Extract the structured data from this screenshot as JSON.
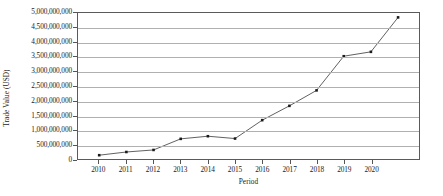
{
  "chart_data": {
    "type": "line",
    "title": "",
    "xlabel": "Period",
    "ylabel": "Trade Value (USD)",
    "categories": [
      "2010",
      "2011",
      "2012",
      "2013",
      "2014",
      "2015",
      "2016",
      "2017",
      "2018",
      "2019",
      "2020",
      "2021"
    ],
    "x_tick_labels": [
      "2010",
      "2011",
      "2012",
      "2013",
      "2014",
      "2015",
      "2016",
      "2017",
      "2018",
      "2019",
      "2020"
    ],
    "values": [
      130000000,
      240000000,
      310000000,
      690000000,
      780000000,
      700000000,
      1330000000,
      1820000000,
      2350000000,
      3520000000,
      3670000000,
      4850000000
    ],
    "y_tick_labels": [
      "5,000,000,000",
      "4,500,000,000",
      "4,000,000,000",
      "3,500,000,000",
      "3,000,000,000",
      "2,500,000,000",
      "2,000,000,000",
      "1,500,000,000",
      "1,000,000,000",
      "500,000,000",
      "0"
    ],
    "y_tick_values": [
      5000000000,
      4500000000,
      4000000000,
      3500000000,
      3000000000,
      2500000000,
      2000000000,
      1500000000,
      1000000000,
      500000000,
      0
    ],
    "ylim": [
      0,
      5000000000
    ],
    "y_tick_interval": 500000000,
    "grid": "horizontal",
    "legend": "none",
    "series": [
      {
        "name": "Trade Value",
        "line_color": "#4d4d4d",
        "marker_color": "#1a1a1a",
        "marker": "square",
        "values": [
          130000000,
          240000000,
          310000000,
          690000000,
          780000000,
          700000000,
          1330000000,
          1820000000,
          2350000000,
          3520000000,
          3670000000,
          4850000000
        ]
      }
    ]
  }
}
